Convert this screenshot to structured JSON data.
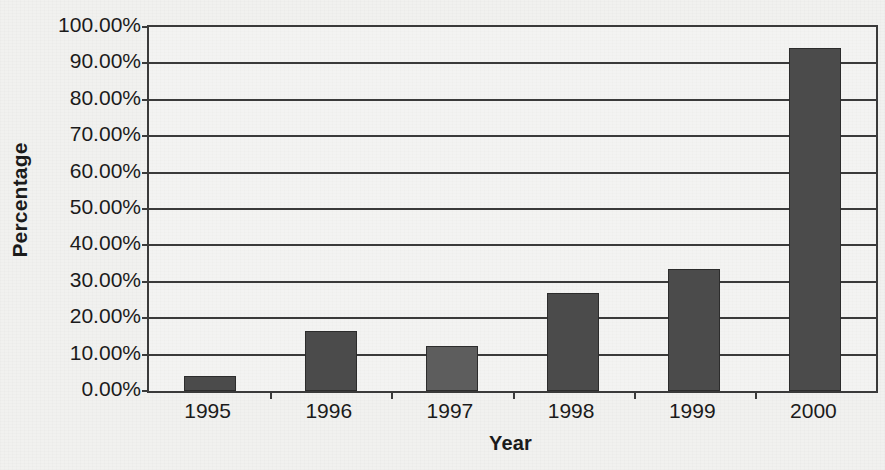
{
  "chart_data": {
    "type": "bar",
    "title": "",
    "subtitle": "",
    "xlabel": "Year",
    "ylabel": "Percentage",
    "categories": [
      "1995",
      "1996",
      "1997",
      "1998",
      "1999",
      "2000"
    ],
    "values": [
      4.2,
      16.6,
      12.5,
      26.9,
      33.4,
      94.2
    ],
    "value_labels": [
      "4.20%",
      "16.60%",
      "12.50%",
      "26.90%",
      "33.40%",
      "94.20%"
    ],
    "ylim": [
      0,
      100
    ],
    "y_tick_values": [
      0,
      10,
      20,
      30,
      40,
      50,
      60,
      70,
      80,
      90,
      100
    ],
    "y_tick_labels": [
      "0.00%",
      "10.00%",
      "20.00%",
      "30.00%",
      "40.00%",
      "50.00%",
      "60.00%",
      "70.00%",
      "80.00%",
      "90.00%",
      "100.00%"
    ],
    "grid": true,
    "grid_axis": "y",
    "legend": false,
    "legend_position": "none",
    "bar_colors": [
      "#4b4b4b",
      "#4b4b4b",
      "#5d5d5d",
      "#4b4b4b",
      "#4b4b4b",
      "#4b4b4b"
    ],
    "axis_color": "#3a3a3a",
    "text_color": "#1b1b1b",
    "background_color": "#f1f1ef",
    "annotations": []
  },
  "axes": {
    "y_title": "Percentage",
    "x_title": "Year"
  }
}
